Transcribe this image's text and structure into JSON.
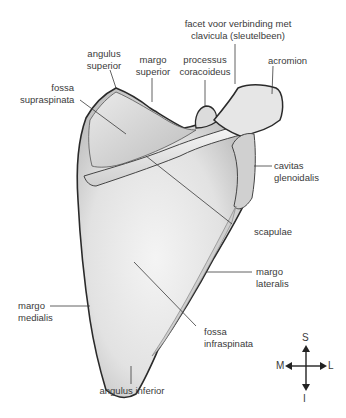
{
  "diagram": {
    "labels": {
      "facet": [
        "facet voor verbinding met",
        "clavicula (sleutelbeen)"
      ],
      "angulus_superior": [
        "angulus",
        "superior"
      ],
      "margo_superior": [
        "margo",
        "superior"
      ],
      "processus_coracoideus": [
        "processus",
        "coracoideus"
      ],
      "acromion": [
        "acromion"
      ],
      "fossa_supraspinata": [
        "fossa",
        "supraspinata"
      ],
      "cavitas_glenoidalis": [
        "cavitas",
        "glenoidalis"
      ],
      "scapulae": [
        "scapulae"
      ],
      "margo_lateralis": [
        "margo",
        "lateralis"
      ],
      "margo_medialis": [
        "margo",
        "medialis"
      ],
      "fossa_infraspinata": [
        "fossa",
        "infraspinata"
      ],
      "angulus_inferior": [
        "angulus inferior"
      ]
    },
    "compass": {
      "up": "S",
      "down": "I",
      "left": "M",
      "right": "L"
    },
    "colors": {
      "outline": "#2a2a2a",
      "bone_light": "#f2f2f2",
      "bone_mid": "#d6d6d6",
      "bone_dark": "#a8a8a8",
      "leader": "#3a3a3a"
    }
  }
}
